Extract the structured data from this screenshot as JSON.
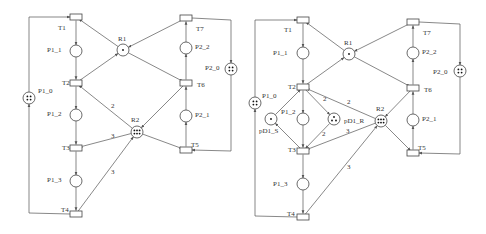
{
  "nets": [
    {
      "id": "left",
      "places": [
        {
          "id": "P1_0",
          "label": "P1_0",
          "x": 29,
          "y": 98,
          "tokens": 4,
          "lx": 38,
          "ly": 91
        },
        {
          "id": "P1_1",
          "label": "P1_1",
          "x": 76,
          "y": 51,
          "tokens": 0,
          "lx": 47,
          "ly": 50
        },
        {
          "id": "P1_2",
          "label": "P1_2",
          "x": 76,
          "y": 115,
          "tokens": 0,
          "lx": 47,
          "ly": 114
        },
        {
          "id": "P1_3",
          "label": "P1_3",
          "x": 76,
          "y": 181,
          "tokens": 0,
          "lx": 47,
          "ly": 180
        },
        {
          "id": "R1",
          "label": "R1",
          "x": 123,
          "y": 50,
          "tokens": 1,
          "lx": 118,
          "ly": 39
        },
        {
          "id": "R2",
          "label": "R2",
          "x": 137,
          "y": 132,
          "tokens": 6,
          "lx": 131,
          "ly": 120
        },
        {
          "id": "P2_0",
          "label": "P2_0",
          "x": 231,
          "y": 69,
          "tokens": 4,
          "lx": 205,
          "ly": 68
        },
        {
          "id": "P2_1",
          "label": "P2_1",
          "x": 186,
          "y": 116,
          "tokens": 0,
          "lx": 195,
          "ly": 115
        },
        {
          "id": "P2_2",
          "label": "P2_2",
          "x": 186,
          "y": 48,
          "tokens": 0,
          "lx": 195,
          "ly": 47
        }
      ],
      "transitions": [
        {
          "id": "T1",
          "label": "T1",
          "x": 76,
          "y": 17,
          "lx": 58,
          "ly": 28
        },
        {
          "id": "T2",
          "label": "T2",
          "x": 76,
          "y": 83,
          "lx": 62,
          "ly": 83
        },
        {
          "id": "T3",
          "label": "T3",
          "x": 76,
          "y": 148,
          "lx": 62,
          "ly": 148
        },
        {
          "id": "T4",
          "label": "T4",
          "x": 76,
          "y": 214,
          "lx": 61,
          "ly": 210
        },
        {
          "id": "T5",
          "label": "T5",
          "x": 186,
          "y": 150,
          "lx": 191,
          "ly": 145
        },
        {
          "id": "T6",
          "label": "T6",
          "x": 186,
          "y": 83,
          "lx": 197,
          "ly": 85
        },
        {
          "id": "T7",
          "label": "T7",
          "x": 186,
          "y": 18,
          "lx": 196,
          "ly": 29
        }
      ],
      "weights": [
        {
          "text": "2",
          "x": 111,
          "y": 108
        },
        {
          "text": "3",
          "x": 111,
          "y": 138
        },
        {
          "text": "3",
          "x": 111,
          "y": 174
        }
      ]
    },
    {
      "id": "right",
      "places": [
        {
          "id": "P1_0",
          "label": "P1_0",
          "x": 255,
          "y": 103,
          "tokens": 4,
          "lx": 262,
          "ly": 96
        },
        {
          "id": "P1_1",
          "label": "P1_1",
          "x": 303,
          "y": 53,
          "tokens": 0,
          "lx": 273,
          "ly": 53
        },
        {
          "id": "P1_2",
          "label": "P1_2",
          "x": 303,
          "y": 119,
          "tokens": 0,
          "lx": 281,
          "ly": 112
        },
        {
          "id": "P1_3",
          "label": "P1_3",
          "x": 303,
          "y": 184,
          "tokens": 0,
          "lx": 273,
          "ly": 184
        },
        {
          "id": "pD1_S",
          "label": "pD1_S",
          "x": 271,
          "y": 119,
          "tokens": 1,
          "lx": 259,
          "ly": 131
        },
        {
          "id": "pD1_R",
          "label": "pD1_R",
          "x": 334,
          "y": 119,
          "tokens": 3,
          "lx": 344,
          "ly": 121
        },
        {
          "id": "R1",
          "label": "R1",
          "x": 349,
          "y": 54,
          "tokens": 1,
          "lx": 344,
          "ly": 43
        },
        {
          "id": "R2",
          "label": "R2",
          "x": 381,
          "y": 121,
          "tokens": 6,
          "lx": 376,
          "ly": 109
        },
        {
          "id": "P2_0",
          "label": "P2_0",
          "x": 460,
          "y": 71,
          "tokens": 4,
          "lx": 433,
          "ly": 72
        },
        {
          "id": "P2_1",
          "label": "P2_1",
          "x": 413,
          "y": 120,
          "tokens": 0,
          "lx": 422,
          "ly": 119
        },
        {
          "id": "P2_2",
          "label": "P2_2",
          "x": 413,
          "y": 53,
          "tokens": 0,
          "lx": 422,
          "ly": 52
        }
      ],
      "transitions": [
        {
          "id": "T1",
          "label": "T1",
          "x": 303,
          "y": 20,
          "lx": 284,
          "ly": 30
        },
        {
          "id": "T2",
          "label": "T2",
          "x": 303,
          "y": 87,
          "lx": 288,
          "ly": 87
        },
        {
          "id": "T3",
          "label": "T3",
          "x": 303,
          "y": 151,
          "lx": 288,
          "ly": 150
        },
        {
          "id": "T4",
          "label": "T4",
          "x": 303,
          "y": 217,
          "lx": 287,
          "ly": 214
        },
        {
          "id": "T5",
          "label": "T5",
          "x": 413,
          "y": 153,
          "lx": 418,
          "ly": 148
        },
        {
          "id": "T6",
          "label": "T6",
          "x": 413,
          "y": 88,
          "lx": 424,
          "ly": 90
        },
        {
          "id": "T7",
          "label": "T7",
          "x": 413,
          "y": 22,
          "lx": 423,
          "ly": 33
        }
      ],
      "weights": [
        {
          "text": "2",
          "x": 323,
          "y": 101
        },
        {
          "text": "2",
          "x": 347,
          "y": 104
        },
        {
          "text": "2",
          "x": 322,
          "y": 136
        },
        {
          "text": "3",
          "x": 346,
          "y": 133
        },
        {
          "text": "3",
          "x": 347,
          "y": 169
        }
      ]
    }
  ]
}
